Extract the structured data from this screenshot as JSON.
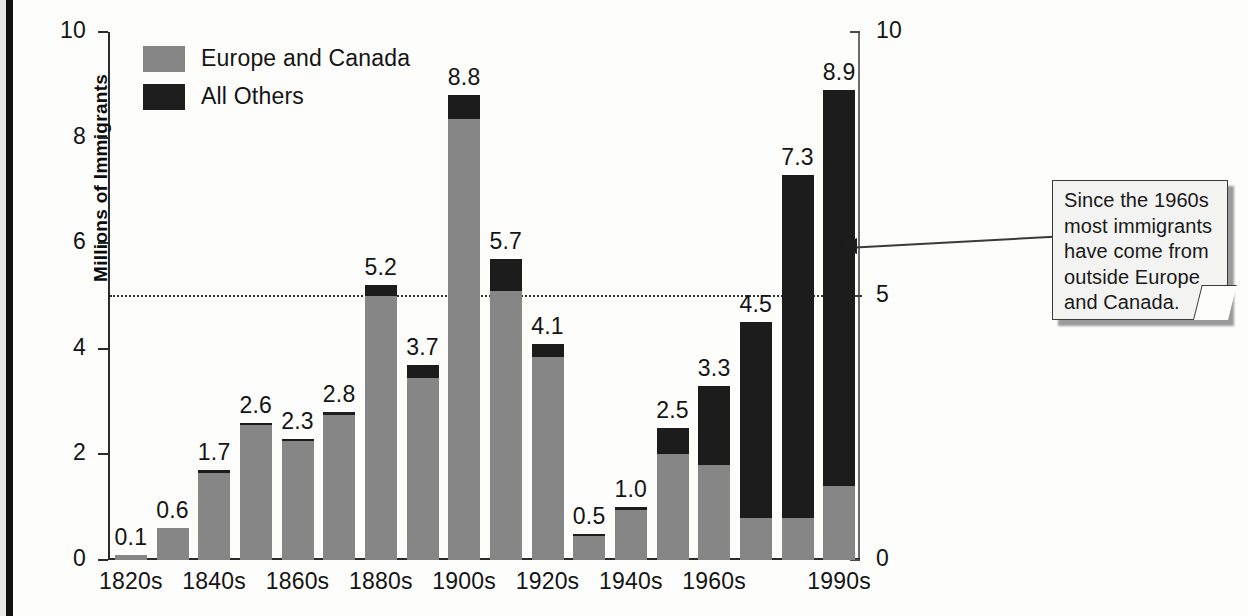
{
  "chart_data": {
    "type": "bar",
    "stacked": true,
    "title": "",
    "xlabel": "",
    "ylabel": "Millions of Immigrants",
    "ylim": [
      0,
      10
    ],
    "grid": false,
    "legend_position": "top-left",
    "categories": [
      "1820s",
      "1830s",
      "1840s",
      "1850s",
      "1860s",
      "1870s",
      "1880s",
      "1890s",
      "1900s",
      "1910s",
      "1920s",
      "1930s",
      "1940s",
      "1950s",
      "1960s",
      "1970s",
      "1980s",
      "1990s"
    ],
    "tick_labels_shown": [
      "1820s",
      "1840s",
      "1860s",
      "1880s",
      "1900s",
      "1920s",
      "1940s",
      "1960s",
      "1990s"
    ],
    "totals": [
      0.1,
      0.6,
      1.7,
      2.6,
      2.3,
      2.8,
      5.2,
      3.7,
      8.8,
      5.7,
      4.1,
      0.5,
      1.0,
      2.5,
      3.3,
      4.5,
      7.3,
      8.9
    ],
    "data_labels": [
      "0.1",
      "0.6",
      "1.7",
      "2.6",
      "2.3",
      "2.8",
      "5.2",
      "3.7",
      "8.8",
      "5.7",
      "4.1",
      "0.5",
      "1.0",
      "2.5",
      "3.3",
      "4.5",
      "7.3",
      "8.9"
    ],
    "series": [
      {
        "name": "Europe and Canada",
        "color": "#868686",
        "values": [
          0.1,
          0.6,
          1.65,
          2.55,
          2.25,
          2.75,
          5.0,
          3.45,
          8.35,
          5.1,
          3.85,
          0.45,
          0.95,
          2.0,
          1.8,
          0.8,
          0.8,
          1.4
        ]
      },
      {
        "name": "All Others",
        "color": "#1c1c1c",
        "values": [
          0.0,
          0.0,
          0.05,
          0.05,
          0.05,
          0.05,
          0.2,
          0.25,
          0.45,
          0.6,
          0.25,
          0.05,
          0.05,
          0.5,
          1.5,
          3.7,
          6.5,
          7.5
        ]
      }
    ],
    "y_ticks_left": [
      "0",
      "2",
      "4",
      "6",
      "8",
      "10"
    ],
    "y_ticks_left_values": [
      0,
      2,
      4,
      6,
      8,
      10
    ],
    "y_ticks_right": [
      "0",
      "5",
      "10"
    ],
    "y_ticks_right_values": [
      0,
      5,
      10
    ],
    "reference_line": {
      "value": 5,
      "style": "dotted"
    }
  },
  "legend": {
    "items": [
      {
        "label": "Europe and Canada",
        "color": "#868686"
      },
      {
        "label": "All Others",
        "color": "#1c1c1c"
      }
    ]
  },
  "axes": {
    "y_label": "Millions of Immigrants"
  },
  "callout": {
    "text": "Since the 1960s most immigrants have come from outside Europe and Canada.",
    "points_to": "reference-line-5"
  }
}
